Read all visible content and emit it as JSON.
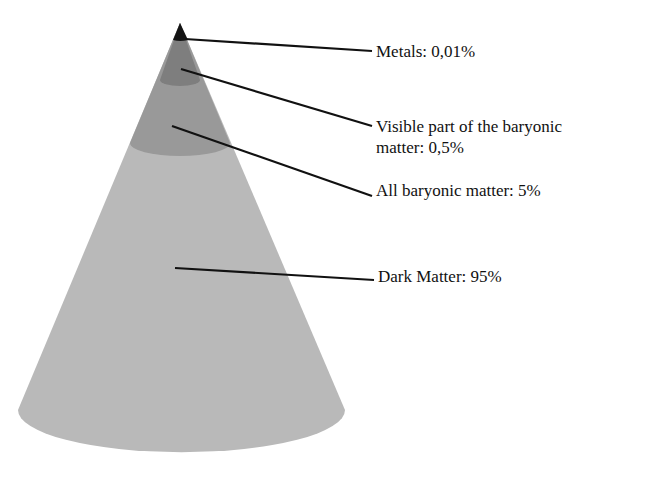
{
  "diagram": {
    "type": "cone",
    "layers": [
      {
        "name": "Metals",
        "value": "0,01%",
        "label": "Metals: 0,01%",
        "color": "#141414"
      },
      {
        "name": "Visible part of the baryonic matter",
        "value": "0,5%",
        "label_line1": "Visible part of the baryonic",
        "label_line2": "matter: 0,5%",
        "color": "#7e7e7e"
      },
      {
        "name": "All baryonic matter",
        "value": "5%",
        "label": "All baryonic matter: 5%",
        "color": "#999999"
      },
      {
        "name": "Dark Matter",
        "value": "95%",
        "label": "Dark Matter: 95%",
        "color": "#b9b9b9"
      }
    ]
  }
}
